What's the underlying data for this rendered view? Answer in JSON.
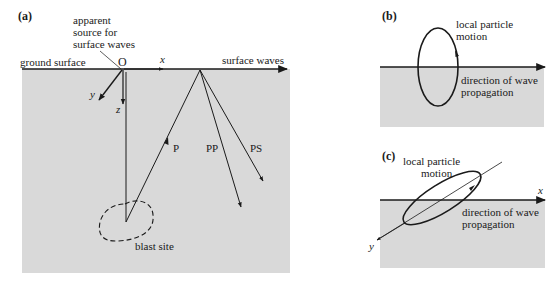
{
  "figure": {
    "panel_a": {
      "label": "(a)",
      "source_label_line1": "apparent",
      "source_label_line2": "source for",
      "source_label_line3": "surface waves",
      "ground_label": "ground surface",
      "origin_label": "O",
      "axis_x": "x",
      "axis_y": "y",
      "axis_z": "z",
      "surface_waves_label": "surface waves",
      "ray_p": "P",
      "ray_pp": "PP",
      "ray_ps": "PS",
      "blast_label": "blast site"
    },
    "panel_b": {
      "label": "(b)",
      "motion_line1": "local particle",
      "motion_line2": "motion",
      "direction_line1": "direction of wave",
      "direction_line2": "propagation"
    },
    "panel_c": {
      "label": "(c)",
      "motion_line1": "local particle",
      "motion_line2": "motion",
      "direction_line1": "direction of wave",
      "direction_line2": "propagation",
      "axis_x": "x",
      "axis_y": "y"
    },
    "colors": {
      "ground_fill": "#d9d9d9",
      "ink": "#1a1a1a"
    }
  }
}
